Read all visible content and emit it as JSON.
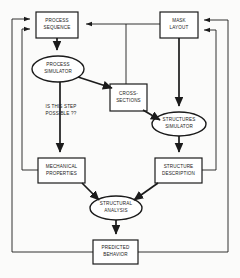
{
  "diagram": {
    "colors": {
      "background": "#fbfbfa",
      "stroke": "#1b1b1b",
      "fill": "#ffffff",
      "text": "#1b1b1b"
    },
    "nodes": [
      {
        "id": "process-sequence",
        "shape": "rectangle",
        "label": "PROCESS\nSEQUENCE",
        "x": 36,
        "y": 12,
        "w": 42,
        "h": 26
      },
      {
        "id": "mask-layout",
        "shape": "rectangle",
        "label": "MASK\nLAYOUT",
        "x": 160,
        "y": 12,
        "w": 38,
        "h": 26
      },
      {
        "id": "process-simulator",
        "shape": "ellipse",
        "label": "PROCESS\nSIMULATOR",
        "x": 32,
        "y": 56,
        "w": 52,
        "h": 26
      },
      {
        "id": "cross-sections",
        "shape": "rectangle",
        "label": "CROSS-\nSECTIONS",
        "x": 110,
        "y": 84,
        "w": 37,
        "h": 27
      },
      {
        "id": "structures-simulator",
        "shape": "ellipse",
        "label": "STRUCTURES\nSIMULATOR",
        "x": 152,
        "y": 112,
        "w": 54,
        "h": 24
      },
      {
        "id": "mechanical-properties",
        "shape": "rectangle",
        "label": "MECHANICAL\nPROPERTIES",
        "x": 38,
        "y": 158,
        "w": 47,
        "h": 25
      },
      {
        "id": "structure-description",
        "shape": "rectangle",
        "label": "STRUCTURE\nDESCRIPTION",
        "x": 155,
        "y": 158,
        "w": 47,
        "h": 25
      },
      {
        "id": "structural-analysis",
        "shape": "ellipse",
        "label": "STRUCTURAL\nANALYSIS",
        "x": 90,
        "y": 196,
        "w": 52,
        "h": 24
      },
      {
        "id": "predicted-behavior",
        "shape": "rectangle",
        "label": "PREDICTED\nBEHAVIOR",
        "x": 93,
        "y": 240,
        "w": 45,
        "h": 24
      }
    ],
    "annotations": [
      {
        "id": "is-this-step-possible",
        "label": "IS THIS STEP\nPOSSIBLE ??",
        "x": 30,
        "y": 104,
        "w": 62,
        "h": 16
      }
    ],
    "edges": [
      {
        "id": "process-sequence-to-process-simulator",
        "from": "process-sequence",
        "to": "process-simulator"
      },
      {
        "id": "process-simulator-to-cross-sections",
        "from": "process-simulator",
        "to": "cross-sections"
      },
      {
        "id": "process-simulator-to-mechanical-properties",
        "from": "process-simulator",
        "to": "mechanical-properties"
      },
      {
        "id": "cross-sections-to-structures-simulator",
        "from": "cross-sections",
        "to": "structures-simulator"
      },
      {
        "id": "mask-layout-to-structures-simulator",
        "from": "mask-layout",
        "to": "structures-simulator"
      },
      {
        "id": "mask-layout-to-process-sequence",
        "from": "mask-layout",
        "to": "process-sequence"
      },
      {
        "id": "mask-layout-to-cross-sections",
        "from": "mask-layout",
        "to": "cross-sections"
      },
      {
        "id": "structures-simulator-to-structure-description",
        "from": "structures-simulator",
        "to": "structure-description"
      },
      {
        "id": "mechanical-properties-to-structural-analysis",
        "from": "mechanical-properties",
        "to": "structural-analysis"
      },
      {
        "id": "structure-description-to-structural-analysis",
        "from": "structure-description",
        "to": "structural-analysis"
      },
      {
        "id": "structural-analysis-to-predicted-behavior",
        "from": "structural-analysis",
        "to": "predicted-behavior"
      },
      {
        "id": "mechanical-properties-feedback-to-process-sequence",
        "from": "mechanical-properties",
        "to": "process-sequence"
      },
      {
        "id": "structure-description-feedback-to-mask-layout",
        "from": "structure-description",
        "to": "mask-layout"
      },
      {
        "id": "predicted-behavior-feedback-to-process-sequence",
        "from": "predicted-behavior",
        "to": "process-sequence"
      },
      {
        "id": "predicted-behavior-feedback-to-mask-layout",
        "from": "predicted-behavior",
        "to": "mask-layout"
      }
    ]
  }
}
